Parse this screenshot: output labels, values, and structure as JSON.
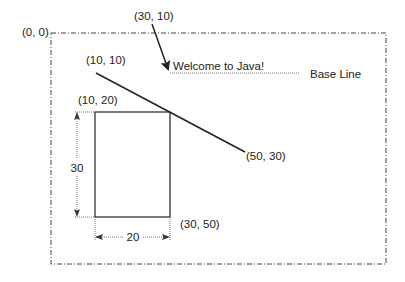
{
  "diagram": {
    "colors": {
      "stroke": "#222222",
      "dotted": "#666666",
      "border": "#444444",
      "text": "#222222"
    },
    "frame": {
      "origin_label": "(0, 0)"
    },
    "string_annotation": {
      "anchor_label": "(30, 10)",
      "text": "Welcome to Java!",
      "baseline_label": "Base Line"
    },
    "line": {
      "start_label": "(10, 10)",
      "end_label": "(50, 30)"
    },
    "rectangle": {
      "top_left_label": "(10, 20)",
      "bottom_right_label": "(30, 50)",
      "height_label": "30",
      "width_label": "20"
    }
  }
}
